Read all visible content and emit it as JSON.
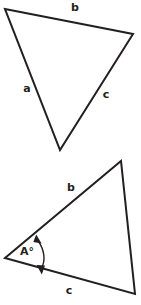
{
  "figure": {
    "background_color": "#ffffff",
    "stroke_color": "#231f20",
    "label_color": "#231f20"
  },
  "triangles": [
    {
      "id": "upper-triangle",
      "name": "upper-triangle",
      "orientation": "point-down",
      "vertices": [
        {
          "name": "top-left-vertex",
          "x": 5,
          "y": 9
        },
        {
          "name": "right-vertex",
          "x": 133,
          "y": 34
        },
        {
          "name": "bottom-vertex",
          "x": 60,
          "y": 150
        }
      ],
      "path": "M 5 9 L 133 34 L 60 150 Z",
      "side_labels": [
        {
          "name": "side-label-b",
          "text": "b",
          "x": 75,
          "y": 8
        },
        {
          "name": "side-label-a",
          "text": "a",
          "x": 27,
          "y": 89
        },
        {
          "name": "side-label-c",
          "text": "c",
          "x": 106,
          "y": 95
        }
      ]
    },
    {
      "id": "lower-triangle",
      "name": "lower-triangle",
      "orientation": "point-right",
      "vertices": [
        {
          "name": "left-vertex",
          "x": 5,
          "y": 258
        },
        {
          "name": "top-vertex",
          "x": 121,
          "y": 161
        },
        {
          "name": "bottom-right-vertex",
          "x": 135,
          "y": 294
        }
      ],
      "path": "M 5 258 L 121 161 L 135 294 Z",
      "side_labels": [
        {
          "name": "side-label-b",
          "text": "b",
          "x": 71,
          "y": 188
        },
        {
          "name": "side-label-c",
          "text": "c",
          "x": 69,
          "y": 291
        }
      ],
      "angle_marker": {
        "name": "angle-marker-A",
        "label": "A°",
        "label_x": 27,
        "label_y": 252,
        "arc_path": "M 37.5 240 C 45 250 45.5 261 41.5 268",
        "arrow_start": {
          "x": 37.5,
          "y": 240
        },
        "arrow_end": {
          "x": 41.5,
          "y": 268
        },
        "double_headed": true
      }
    }
  ]
}
